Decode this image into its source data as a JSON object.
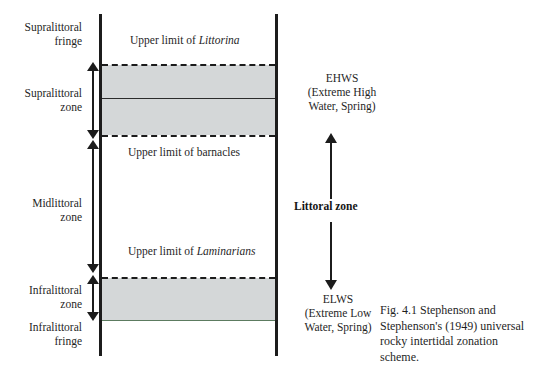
{
  "figure": {
    "caption": "Fig. 4.1  Stephenson and Stephenson's (1949) universal rocky intertidal zonation scheme."
  },
  "zones": [
    {
      "id": "supralittoral-fringe",
      "label": "Supralittoral\nfringe"
    },
    {
      "id": "supralittoral-zone",
      "label": "Supralittoral\nzone"
    },
    {
      "id": "midlittoral-zone",
      "label": "Midlittoral\nzone"
    },
    {
      "id": "infralittoral-zone",
      "label": "Infralittoral\nzone"
    },
    {
      "id": "infralittoral-fringe",
      "label": "Infralittoral\nfringe"
    }
  ],
  "zone_labels": {
    "supralittoral_fringe_line1": "Supralittoral",
    "supralittoral_fringe_line2": "fringe",
    "supralittoral_zone_line1": "Supralittoral",
    "supralittoral_zone_line2": "zone",
    "midlittoral_zone_line1": "Midlittoral",
    "midlittoral_zone_line2": "zone",
    "infralittoral_zone_line1": "Infralittoral",
    "infralittoral_zone_line2": "zone",
    "infralittoral_fringe_line1": "Infralittoral",
    "infralittoral_fringe_line2": "fringe"
  },
  "boundaries": [
    {
      "id": "upper-limit-littorina",
      "prefix": "Upper limit of ",
      "taxon": "Littorina",
      "style": "dashed"
    },
    {
      "id": "supralittoral-internal",
      "prefix": "",
      "taxon": "",
      "style": "solid"
    },
    {
      "id": "upper-limit-barnacles",
      "prefix": "Upper limit of barnacles",
      "taxon": "",
      "style": "dashed"
    },
    {
      "id": "upper-limit-laminarians",
      "prefix": "Upper limit of ",
      "taxon": "Laminarians",
      "style": "dashed"
    },
    {
      "id": "infralittoral-base",
      "prefix": "",
      "taxon": "",
      "style": "thin"
    }
  ],
  "limit_labels": {
    "littorina_prefix": "Upper limit of ",
    "littorina_taxon": "Littorina",
    "barnacles": "Upper limit of barnacles",
    "laminarians_prefix": "Upper limit of ",
    "laminarians_taxon": "Laminarians"
  },
  "tide_marks": {
    "ehws_abbr": "EHWS",
    "ehws_expansion_line1": "(Extreme High",
    "ehws_expansion_line2": "Water, Spring)",
    "elws_abbr": "ELWS",
    "elws_expansion_line1": "(Extreme Low",
    "elws_expansion_line2": "Water, Spring)"
  },
  "littoral": {
    "label": "Littoral zone"
  },
  "colors": {
    "band_fill": "#d4d7d8",
    "line": "#1c1c1c",
    "thin_rule": "#5c7b60",
    "text": "#1f1f1f",
    "background": "#ffffff"
  }
}
